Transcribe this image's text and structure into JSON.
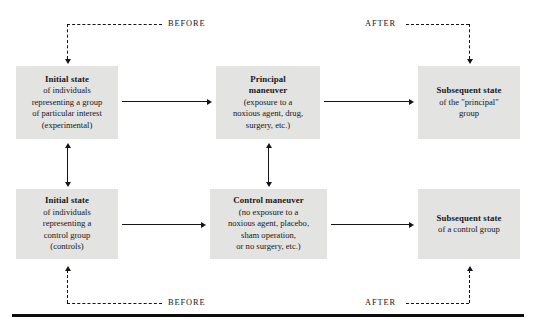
{
  "diagram": {
    "colors": {
      "box_fill": "#e3e3e1",
      "line": "#14141a",
      "text": "#17171a",
      "page_background": "#ffffff"
    },
    "boxes": {
      "initial_experimental": {
        "title": "Initial state",
        "lines": [
          "of individuals",
          "representing a group",
          "of particular interest",
          "(experimental)"
        ]
      },
      "principal_maneuver": {
        "title_line1": "Principal",
        "title_line2": "maneuver",
        "lines": [
          "(exposure to a",
          "noxious agent, drug,",
          "surgery, etc.)"
        ]
      },
      "subsequent_principal": {
        "title": "Subsequent state",
        "lines": [
          "of the \"principal\"",
          "group"
        ]
      },
      "initial_control": {
        "title": "Initial state",
        "lines": [
          "of individuals",
          "representing a",
          "control group",
          "(controls)"
        ]
      },
      "control_maneuver": {
        "title": "Control maneuver",
        "lines": [
          "(no exposure to a",
          "noxious agent, placebo,",
          "sham operation,",
          "or no surgery, etc.)"
        ]
      },
      "subsequent_control": {
        "title": "Subsequent state",
        "lines": [
          "of a control group"
        ]
      }
    },
    "flow_labels": {
      "top_before": "BEFORE",
      "top_after": "AFTER",
      "bottom_before": "BEFORE",
      "bottom_after": "AFTER"
    }
  }
}
